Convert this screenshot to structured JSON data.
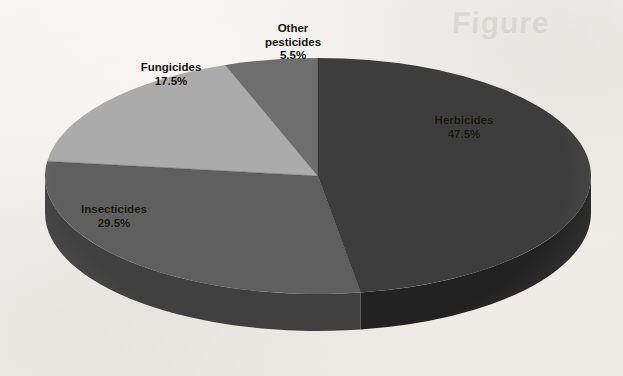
{
  "figure": {
    "background_color": "#fbfaf8",
    "ghost_text": "Figure",
    "ghost_text_2": ""
  },
  "chart_data": {
    "type": "pie",
    "title": "",
    "subtitle": "",
    "xlabel": "",
    "ylabel": "",
    "legend_position": "none",
    "grid": false,
    "three_d": true,
    "start_angle_deg": 0,
    "direction": "clockwise",
    "units": "percent",
    "total": 100.0,
    "categories": [
      "Herbicides",
      "Insecticides",
      "Fungicides",
      "Other pesticides"
    ],
    "values": [
      47.5,
      29.5,
      17.5,
      5.5
    ],
    "value_labels": [
      "47.5%",
      "29.5%",
      "17.5%",
      "5.5%"
    ],
    "colors": [
      "#3c3c3c",
      "#5f5f5f",
      "#ababab",
      "#6e6e6e"
    ],
    "side_colors": [
      "#232323",
      "#414141",
      "#6f6f6f",
      "#454545"
    ],
    "slices": [
      {
        "name": "Herbicides",
        "label": "Herbicides",
        "value": 47.5,
        "value_label": "47.5%",
        "color": "#3c3c3c",
        "side_color": "#232323",
        "start_deg": 0.0,
        "end_deg": 171.0
      },
      {
        "name": "Insecticides",
        "label": "Insecticides",
        "value": 29.5,
        "value_label": "29.5%",
        "color": "#5f5f5f",
        "side_color": "#414141",
        "start_deg": 171.0,
        "end_deg": 277.2
      },
      {
        "name": "Fungicides",
        "label": "Fungicides",
        "value": 17.5,
        "value_label": "17.5%",
        "color": "#ababab",
        "side_color": "#6f6f6f",
        "start_deg": 277.2,
        "end_deg": 340.2
      },
      {
        "name": "Other pesticides",
        "label": "Other pesticides",
        "value": 5.5,
        "value_label": "5.5%",
        "color": "#6e6e6e",
        "side_color": "#454545",
        "start_deg": 340.2,
        "end_deg": 360.0
      }
    ]
  },
  "labels": {
    "herbicides": {
      "name": "Herbicides",
      "percent": "47.5%"
    },
    "insecticides": {
      "name": "Insecticides",
      "percent": "29.5%"
    },
    "fungicides": {
      "name": "Fungicides",
      "percent": "17.5%"
    },
    "other": {
      "name_line1": "Other",
      "name_line2": "pesticides",
      "percent": "5.5%"
    }
  }
}
